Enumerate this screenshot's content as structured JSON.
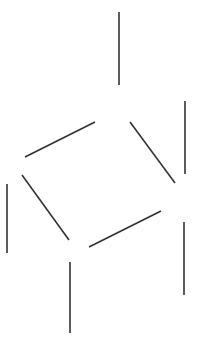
{
  "diagram": {
    "type": "skeletal-structure",
    "background": "#ffffff",
    "stroke_color": "#333333",
    "segments": [
      {
        "id": "top-vertical",
        "x1": 119,
        "y1": 12,
        "x2": 119,
        "y2": 85
      },
      {
        "id": "upper-left-diagonal",
        "x1": 25,
        "y1": 157,
        "x2": 95,
        "y2": 122
      },
      {
        "id": "upper-right-diagonal",
        "x1": 130,
        "y1": 122,
        "x2": 175,
        "y2": 183
      },
      {
        "id": "right-upper-vertical",
        "x1": 185,
        "y1": 101,
        "x2": 185,
        "y2": 174
      },
      {
        "id": "left-vertical",
        "x1": 7,
        "y1": 184,
        "x2": 7,
        "y2": 253
      },
      {
        "id": "lower-left-diagonal",
        "x1": 22,
        "y1": 175,
        "x2": 69,
        "y2": 240
      },
      {
        "id": "lower-right-diagonal",
        "x1": 89,
        "y1": 247,
        "x2": 161,
        "y2": 211
      },
      {
        "id": "right-lower-vertical",
        "x1": 184,
        "y1": 222,
        "x2": 184,
        "y2": 295
      },
      {
        "id": "bottom-vertical",
        "x1": 70,
        "y1": 262,
        "x2": 70,
        "y2": 333
      }
    ]
  }
}
